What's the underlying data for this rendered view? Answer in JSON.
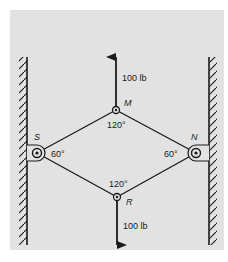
{
  "diagram": {
    "panel_color": "#e2e2e2",
    "line_color": "#1a1a1a",
    "joints": {
      "top": {
        "label": "M",
        "angle": "120°"
      },
      "bottom": {
        "label": "R",
        "angle": "120°"
      },
      "left": {
        "label": "S",
        "angle": "60°"
      },
      "right": {
        "label": "N",
        "angle": "60°"
      }
    },
    "forces": {
      "up": {
        "value": "100 lb"
      },
      "down": {
        "value": "100 lb"
      }
    },
    "walls": [
      "left-wall",
      "right-wall"
    ]
  }
}
